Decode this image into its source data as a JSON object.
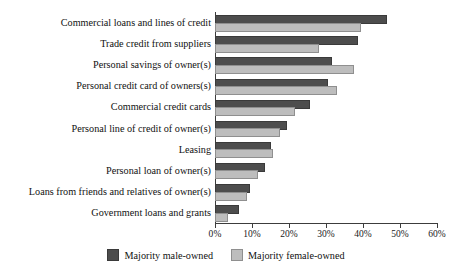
{
  "chart_data": {
    "type": "bar",
    "orientation": "horizontal",
    "title": "",
    "xlabel": "",
    "ylabel": "",
    "xlim": [
      0,
      60
    ],
    "xticks": [
      0,
      10,
      20,
      30,
      40,
      50,
      60
    ],
    "xtick_labels": [
      "0%",
      "10%",
      "20%",
      "30%",
      "40%",
      "50%",
      "60%"
    ],
    "grid": false,
    "legend_position": "bottom",
    "categories": [
      "Commercial loans and lines of credit",
      "Trade credit from suppliers",
      "Personal savings of owner(s)",
      "Personal credit card of owners(s)",
      "Commercial credit cards",
      "Personal line of credit of owner(s)",
      "Leasing",
      "Personal loan of owner(s)",
      "Loans from friends and relatives of owner(s)",
      "Government loans and grants"
    ],
    "series": [
      {
        "name": "Majority male-owned",
        "color": "#4d4d4d",
        "values": [
          46,
          38,
          31,
          30,
          25,
          19,
          14.5,
          13,
          9,
          6
        ]
      },
      {
        "name": "Majority female-owned",
        "color": "#bdbdbd",
        "values": [
          39,
          27.5,
          37,
          32.5,
          21,
          17,
          15,
          11,
          8,
          3
        ]
      }
    ]
  },
  "legend": {
    "items": [
      {
        "label": "Majority male-owned",
        "swatch": "male"
      },
      {
        "label": "Majority female-owned",
        "swatch": "female"
      }
    ]
  },
  "colors": {
    "male_bar": "#4d4d4d",
    "female_bar": "#bdbdbd",
    "axis": "#3c3c3c",
    "background": "#ffffff"
  }
}
